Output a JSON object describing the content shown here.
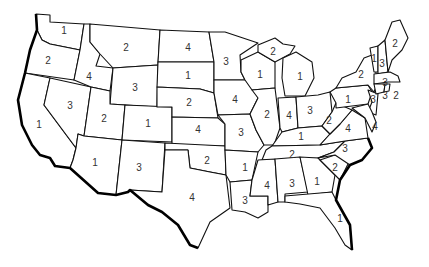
{
  "colors": {
    "stroke": "#111111",
    "fill": "#ffffff",
    "label": "#333333"
  },
  "states": [
    {
      "id": "WA",
      "value": "1",
      "x": 64,
      "y": 31
    },
    {
      "id": "OR",
      "value": "2",
      "x": 48,
      "y": 61
    },
    {
      "id": "CA",
      "value": "1",
      "x": 39,
      "y": 125
    },
    {
      "id": "NV",
      "value": "3",
      "x": 70,
      "y": 106
    },
    {
      "id": "ID",
      "value": "4",
      "x": 89,
      "y": 77
    },
    {
      "id": "MT",
      "value": "2",
      "x": 126,
      "y": 48
    },
    {
      "id": "WY",
      "value": "3",
      "x": 135,
      "y": 88
    },
    {
      "id": "UT",
      "value": "2",
      "x": 104,
      "y": 119
    },
    {
      "id": "CO",
      "value": "1",
      "x": 148,
      "y": 124
    },
    {
      "id": "AZ",
      "value": "1",
      "x": 95,
      "y": 163
    },
    {
      "id": "NM",
      "value": "3",
      "x": 139,
      "y": 168
    },
    {
      "id": "ND",
      "value": "4",
      "x": 188,
      "y": 48
    },
    {
      "id": "SD",
      "value": "1",
      "x": 188,
      "y": 76
    },
    {
      "id": "NE",
      "value": "2",
      "x": 189,
      "y": 103
    },
    {
      "id": "KS",
      "value": "4",
      "x": 198,
      "y": 130
    },
    {
      "id": "OK",
      "value": "2",
      "x": 207,
      "y": 161
    },
    {
      "id": "TX",
      "value": "4",
      "x": 192,
      "y": 198
    },
    {
      "id": "MN",
      "value": "3",
      "x": 226,
      "y": 62
    },
    {
      "id": "IA",
      "value": "4",
      "x": 235,
      "y": 100
    },
    {
      "id": "MO",
      "value": "3",
      "x": 241,
      "y": 133
    },
    {
      "id": "AR",
      "value": "1",
      "x": 245,
      "y": 168
    },
    {
      "id": "LA",
      "value": "3",
      "x": 245,
      "y": 201
    },
    {
      "id": "WI",
      "value": "1",
      "x": 260,
      "y": 75
    },
    {
      "id": "IL",
      "value": "2",
      "x": 267,
      "y": 115
    },
    {
      "id": "MI-UP",
      "value": "2",
      "x": 273,
      "y": 52
    },
    {
      "id": "MI",
      "value": "1",
      "x": 300,
      "y": 77
    },
    {
      "id": "IN",
      "value": "4",
      "x": 289,
      "y": 116
    },
    {
      "id": "OH",
      "value": "3",
      "x": 310,
      "y": 111
    },
    {
      "id": "KY",
      "value": "1",
      "x": 301,
      "y": 137
    },
    {
      "id": "TN",
      "value": "2",
      "x": 292,
      "y": 155
    },
    {
      "id": "MS",
      "value": "4",
      "x": 267,
      "y": 186
    },
    {
      "id": "AL",
      "value": "3",
      "x": 292,
      "y": 184
    },
    {
      "id": "GA",
      "value": "1",
      "x": 317,
      "y": 182
    },
    {
      "id": "FL",
      "value": "1",
      "x": 340,
      "y": 219
    },
    {
      "id": "SC",
      "value": "2",
      "x": 335,
      "y": 168
    },
    {
      "id": "NC",
      "value": "3",
      "x": 345,
      "y": 149
    },
    {
      "id": "VA",
      "value": "4",
      "x": 348,
      "y": 129
    },
    {
      "id": "WV",
      "value": "2",
      "x": 329,
      "y": 121
    },
    {
      "id": "PA",
      "value": "1",
      "x": 348,
      "y": 100
    },
    {
      "id": "NY",
      "value": "2",
      "x": 361,
      "y": 75
    },
    {
      "id": "NJ",
      "value": "3",
      "x": 373,
      "y": 100
    },
    {
      "id": "MD-DE",
      "value": "4",
      "x": 375,
      "y": 127
    },
    {
      "id": "VT",
      "value": "1",
      "x": 374,
      "y": 59
    },
    {
      "id": "NH",
      "value": "3",
      "x": 382,
      "y": 64
    },
    {
      "id": "ME",
      "value": "2",
      "x": 395,
      "y": 44
    },
    {
      "id": "MA",
      "value": "3",
      "x": 385,
      "y": 83
    },
    {
      "id": "CT",
      "value": "3",
      "x": 385,
      "y": 96
    },
    {
      "id": "RI",
      "value": "2",
      "x": 396,
      "y": 96
    }
  ]
}
